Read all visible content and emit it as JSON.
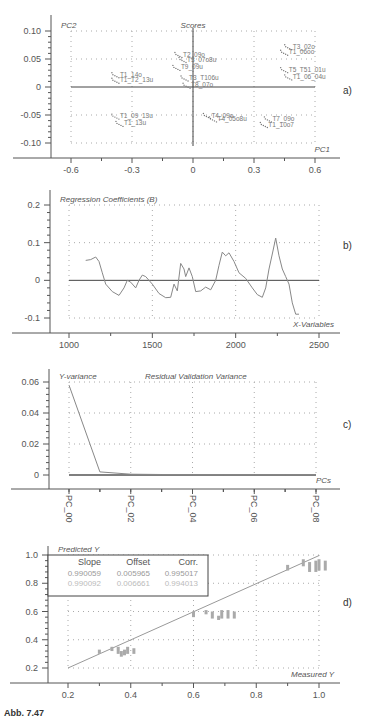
{
  "figure": {
    "caption": "Abb. 7.47"
  },
  "chart_data": [
    {
      "panel": "a)",
      "type": "scatter",
      "title": "Scores",
      "xlabel": "PC1",
      "ylabel": "PC2",
      "xlim": [
        -0.7,
        0.7
      ],
      "ylim": [
        -0.12,
        0.12
      ],
      "xticks": [
        -0.6,
        -0.3,
        0,
        0.3,
        0.6
      ],
      "xtick_labels": [
        "-0.6",
        "-0.3",
        "0",
        "0.3",
        "0.6"
      ],
      "yticks": [
        0.1,
        0.05,
        0,
        -0.05,
        -0.1
      ],
      "ytick_labels": [
        "0.10",
        "0.05",
        "0",
        "-0.05",
        "-0.10"
      ],
      "grid": true,
      "clusters": [
        {
          "label": "T3_02o",
          "x": 0.52,
          "y": 0.072
        },
        {
          "label": "T1_06oo",
          "x": 0.5,
          "y": 0.062
        },
        {
          "label": "T5_T51_01u",
          "x": 0.5,
          "y": 0.031
        },
        {
          "label": "T1_06_04u",
          "x": 0.52,
          "y": 0.018
        },
        {
          "label": "T2_09o",
          "x": -0.02,
          "y": 0.058
        },
        {
          "label": "T3_07o8u",
          "x": 0.0,
          "y": 0.049
        },
        {
          "label": "T9_09u",
          "x": -0.03,
          "y": 0.035
        },
        {
          "label": "T3_T106u",
          "x": 0.01,
          "y": 0.016
        },
        {
          "label": "T8_07o",
          "x": 0.02,
          "y": 0.003
        },
        {
          "label": "T1_14o",
          "x": -0.33,
          "y": 0.022
        },
        {
          "label": "T1_T2_13u",
          "x": -0.33,
          "y": 0.012
        },
        {
          "label": "T1_09_13u",
          "x": -0.33,
          "y": -0.052
        },
        {
          "label": "T1_13u",
          "x": -0.31,
          "y": -0.065
        },
        {
          "label": "T4_09o",
          "x": 0.12,
          "y": -0.051
        },
        {
          "label": "T4_05o8u",
          "x": 0.15,
          "y": -0.057
        },
        {
          "label": "T7_09o",
          "x": 0.42,
          "y": -0.057
        },
        {
          "label": "T1_10o7",
          "x": 0.4,
          "y": -0.067
        }
      ]
    },
    {
      "panel": "b)",
      "type": "line",
      "title": "Regression Coefficients (B)",
      "xlabel": "X-Variables",
      "ylabel": "",
      "xlim": [
        880,
        2620
      ],
      "ylim": [
        -0.13,
        0.23
      ],
      "xticks": [
        1000,
        1500,
        2000,
        2500
      ],
      "xtick_labels": [
        "1000",
        "1500",
        "2000",
        "2500"
      ],
      "yticks": [
        0.2,
        0.1,
        0,
        -0.1
      ],
      "ytick_labels": [
        "0.2",
        "0.1",
        "0",
        "-0.1"
      ],
      "grid": true,
      "x": [
        1100,
        1130,
        1160,
        1180,
        1200,
        1220,
        1260,
        1300,
        1330,
        1350,
        1370,
        1400,
        1420,
        1440,
        1460,
        1500,
        1540,
        1580,
        1610,
        1630,
        1650,
        1670,
        1690,
        1700,
        1720,
        1740,
        1760,
        1790,
        1820,
        1850,
        1880,
        1900,
        1920,
        1940,
        1960,
        1990,
        2020,
        2060,
        2100,
        2130,
        2160,
        2180,
        2200,
        2220,
        2240,
        2260,
        2280,
        2300,
        2320,
        2340,
        2360,
        2380
      ],
      "values": [
        0.053,
        0.055,
        0.062,
        0.05,
        0.02,
        -0.01,
        -0.03,
        -0.04,
        -0.02,
        0.0,
        -0.005,
        -0.02,
        0.0,
        0.014,
        0.01,
        -0.01,
        -0.035,
        -0.046,
        -0.045,
        -0.01,
        -0.028,
        0.045,
        0.03,
        0.01,
        0.033,
        0.01,
        -0.03,
        -0.028,
        -0.018,
        -0.025,
        0.0,
        0.04,
        0.075,
        0.065,
        0.073,
        0.05,
        0.02,
        0.005,
        -0.02,
        -0.038,
        -0.045,
        -0.02,
        0.03,
        0.07,
        0.112,
        0.065,
        0.03,
        0.01,
        -0.01,
        -0.06,
        -0.09,
        -0.09
      ]
    },
    {
      "panel": "c)",
      "type": "line",
      "title": "Residual Validation Variance",
      "xlabel": "PCs",
      "ylabel": "Y-variance",
      "xlim": [
        -0.7,
        8.7
      ],
      "ylim": [
        -0.009,
        0.066
      ],
      "categories": [
        "PC_00",
        "PC_01",
        "PC_02",
        "PC_03",
        "PC_04",
        "PC_05",
        "PC_06",
        "PC_07",
        "PC_08"
      ],
      "xtick_labels": [
        "PC_00",
        "PC_02",
        "PC_04",
        "PC_06",
        "PC_08"
      ],
      "yticks": [
        0.06,
        0.04,
        0.02,
        0
      ],
      "ytick_labels": [
        "0.06",
        "0.04",
        "0.02",
        "0"
      ],
      "grid": true,
      "values": [
        0.058,
        0.002,
        0.0005,
        0.0003,
        0.0002,
        0.0002,
        0.0002,
        0.0002,
        0.0002
      ]
    },
    {
      "panel": "d)",
      "type": "scatter",
      "title": "",
      "xlabel": "Measured Y",
      "ylabel": "Predicted Y",
      "xlim": [
        0.06,
        1.15
      ],
      "ylim": [
        0.1,
        1.07
      ],
      "xticks": [
        0.2,
        0.4,
        0.6,
        0.8,
        1.0
      ],
      "xtick_labels": [
        "0.2",
        "0.4",
        "0.6",
        "0.8",
        "1.0"
      ],
      "yticks": [
        1.0,
        0.8,
        0.6,
        0.4,
        0.2
      ],
      "ytick_labels": [
        "1.0",
        "0.8",
        "0.6",
        "0.4",
        "0.2"
      ],
      "grid": true,
      "stats_table": {
        "headers": [
          "Slope",
          "Offset",
          "Corr."
        ],
        "rows": [
          [
            "0.990059",
            "0.005965",
            "0.995017"
          ],
          [
            "0.990092",
            "0.006661",
            "0.994013"
          ]
        ]
      },
      "regression_line": {
        "x": [
          0.2,
          1.0
        ],
        "y": [
          0.2,
          0.996
        ]
      },
      "groups": [
        {
          "x": 0.3,
          "y_min": 0.3,
          "y_max": 0.33
        },
        {
          "x": 0.34,
          "y_min": 0.32,
          "y_max": 0.35
        },
        {
          "x": 0.36,
          "y_min": 0.3,
          "y_max": 0.35
        },
        {
          "x": 0.37,
          "y_min": 0.28,
          "y_max": 0.32
        },
        {
          "x": 0.38,
          "y_min": 0.29,
          "y_max": 0.33
        },
        {
          "x": 0.39,
          "y_min": 0.3,
          "y_max": 0.35
        },
        {
          "x": 0.41,
          "y_min": 0.3,
          "y_max": 0.34
        },
        {
          "x": 0.6,
          "y_min": 0.56,
          "y_max": 0.6
        },
        {
          "x": 0.64,
          "y_min": 0.58,
          "y_max": 0.61
        },
        {
          "x": 0.66,
          "y_min": 0.55,
          "y_max": 0.6
        },
        {
          "x": 0.68,
          "y_min": 0.54,
          "y_max": 0.57
        },
        {
          "x": 0.69,
          "y_min": 0.55,
          "y_max": 0.61
        },
        {
          "x": 0.71,
          "y_min": 0.55,
          "y_max": 0.61
        },
        {
          "x": 0.73,
          "y_min": 0.55,
          "y_max": 0.6
        },
        {
          "x": 0.9,
          "y_min": 0.89,
          "y_max": 0.93
        },
        {
          "x": 0.95,
          "y_min": 0.92,
          "y_max": 0.97
        },
        {
          "x": 0.97,
          "y_min": 0.88,
          "y_max": 0.95
        },
        {
          "x": 0.99,
          "y_min": 0.88,
          "y_max": 0.96
        },
        {
          "x": 1.0,
          "y_min": 0.89,
          "y_max": 0.97
        },
        {
          "x": 1.02,
          "y_min": 0.89,
          "y_max": 0.96
        }
      ]
    }
  ]
}
